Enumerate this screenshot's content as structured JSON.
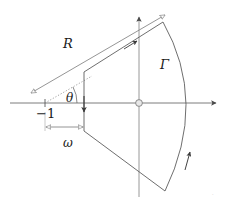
{
  "figure": {
    "type": "contour-diagram",
    "background_color": "#ffffff",
    "line_color": "#555555",
    "axis_color": "#6e6e6e",
    "text_color": "#1a1a1a",
    "labels": {
      "radius": "R",
      "contour": "Γ",
      "angle": "θ",
      "branch_point": "−1",
      "offset": "ω",
      "corner_mark": "·"
    },
    "axes": {
      "horizontal": {
        "name": "real-axis",
        "y": 103,
        "x_start": 10,
        "x_end": 224,
        "arrow": "right"
      },
      "vertical": {
        "name": "imaginary-axis",
        "x": 139,
        "y_start": 197,
        "y_end": 11,
        "arrow": "up"
      },
      "origin": {
        "x": 139,
        "y": 103,
        "marker": "open-circle"
      }
    },
    "points": {
      "branch_point": {
        "x": 45,
        "y": 103
      },
      "vertex_upper": {
        "x": 84,
        "y": 72
      },
      "vertex_lower": {
        "x": 84,
        "y": 131
      },
      "arc_top": {
        "x": 163,
        "y": 22
      },
      "arc_right": {
        "x": 194,
        "y": 103
      },
      "arc_bottom": {
        "x": 165,
        "y": 191
      }
    },
    "dimension_lines": [
      {
        "name": "radius-dimension",
        "label": "R",
        "from": {
          "x": 30,
          "y": 92
        },
        "to": {
          "x": 166,
          "y": 14
        },
        "arrowheads": "both",
        "style": "hollow"
      },
      {
        "name": "omega-dimension",
        "label": "ω",
        "from": {
          "x": 45,
          "y": 127
        },
        "to": {
          "x": 84,
          "y": 127
        },
        "arrowheads": "both",
        "style": "hollow"
      }
    ],
    "contour_arrows": [
      {
        "name": "upper-ray-arrow",
        "direction": "up-right",
        "position": {
          "x": 134,
          "y": 43
        }
      },
      {
        "name": "vertical-segment-arrow",
        "direction": "down",
        "position": {
          "x": 84,
          "y": 112
        }
      },
      {
        "name": "arc-arrow",
        "direction": "counterclockwise-up",
        "position": {
          "x": 182,
          "y": 158
        }
      }
    ]
  }
}
